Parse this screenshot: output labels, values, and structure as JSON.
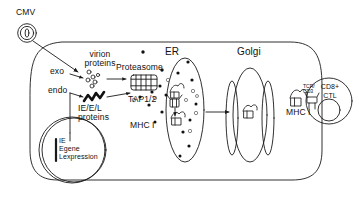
{
  "figure": {
    "type": "biology-pathway-diagram",
    "title_visible": false,
    "background_color": "#ffffff",
    "line_color": "#1a1a1a"
  },
  "virus": {
    "name": "CMV",
    "icon": "virion-particle-icon"
  },
  "entry": {
    "exocytosis_label": "exo",
    "endocytosis_label": "endo"
  },
  "proteins": {
    "virion_line1": "virion",
    "virion_line2": "proteins",
    "iel_line1": "IE/E/L",
    "iel_line2": "proteins"
  },
  "machinery": {
    "proteasome": "Proteasome",
    "tap": "TAP1/2",
    "mhc_er": "MHC I",
    "mhc_surface": "MHC I"
  },
  "organelles": {
    "er": "ER",
    "golgi": "Golgi"
  },
  "nucleus": {
    "bracket_lines": [
      "IE",
      "E",
      "L"
    ],
    "text_line1": "IE",
    "text_line2": "Egene",
    "text_line3": "Lexpression",
    "gene_word": "gene",
    "expression_word": "expression"
  },
  "tcell": {
    "receptor_line1": "TCR/",
    "receptor_line2": "CD3",
    "name_line1": "CD8+",
    "name_line2": "CTL"
  },
  "colors": {
    "stroke": "#1a1a1a",
    "peptide_fill": "#111111",
    "background": "#ffffff"
  }
}
